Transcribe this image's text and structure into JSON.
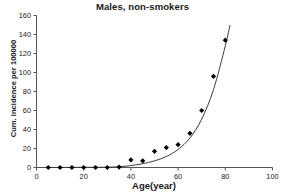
{
  "chart_data": {
    "type": "scatter",
    "title": "Males, non-smokers",
    "xlabel": "Age(year)",
    "ylabel": "Cum. incidence per 100000",
    "xlim": [
      0,
      100
    ],
    "ylim": [
      0,
      160
    ],
    "xticks": [
      0,
      20,
      40,
      60,
      80,
      100
    ],
    "yticks": [
      0,
      20,
      40,
      60,
      80,
      100,
      120,
      140,
      160
    ],
    "xtick_labels": [
      "0",
      "20",
      "40",
      "60",
      "80",
      "100"
    ],
    "ytick_labels": [
      "0",
      "20",
      "40",
      "60",
      "80",
      "100",
      "120",
      "140",
      "160"
    ],
    "grid": false,
    "legend": "none",
    "marker": "filled-diamond",
    "marker_color": "#000000",
    "line_color": "#3a3a3a",
    "axis_color": "#555555",
    "x": [
      5,
      10,
      15,
      20,
      25,
      30,
      35,
      40,
      45,
      50,
      55,
      60,
      65,
      70,
      75,
      80
    ],
    "values": [
      0,
      0,
      0,
      0,
      0,
      0,
      0.5,
      8,
      7,
      17,
      21,
      24,
      36,
      60,
      96,
      134
    ],
    "series": [
      {
        "name": "Observed cumulative incidence",
        "x": [
          5,
          10,
          15,
          20,
          25,
          30,
          35,
          40,
          45,
          50,
          55,
          60,
          65,
          70,
          75,
          80
        ],
        "values": [
          0,
          0,
          0,
          0,
          0,
          0,
          0.5,
          8,
          7,
          17,
          21,
          24,
          36,
          60,
          96,
          134
        ]
      },
      {
        "name": "Fitted exponential curve",
        "x": [
          30,
          35,
          40,
          45,
          50,
          55,
          60,
          65,
          70,
          75,
          80,
          82
        ],
        "values": [
          0.3,
          0.8,
          2.0,
          4.0,
          7.0,
          11.5,
          19.0,
          31.0,
          51.0,
          82.0,
          128.0,
          150.0
        ]
      }
    ]
  }
}
